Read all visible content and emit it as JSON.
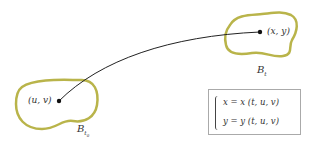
{
  "diagram": {
    "colors": {
      "region_stroke": "#b9b44a",
      "curve": "#222222",
      "text": "#333333",
      "box_border": "#aaaaaa"
    },
    "start_point": {
      "label": "(u, v)"
    },
    "end_point": {
      "label": "(x, y)"
    },
    "region_start": {
      "label_base": "B",
      "label_sub": "t",
      "label_subsub": "0"
    },
    "region_end": {
      "label_base": "B",
      "label_sub": "t"
    },
    "equations": [
      "x = x (t, u, v)",
      "y = y (t, u, v)"
    ]
  }
}
